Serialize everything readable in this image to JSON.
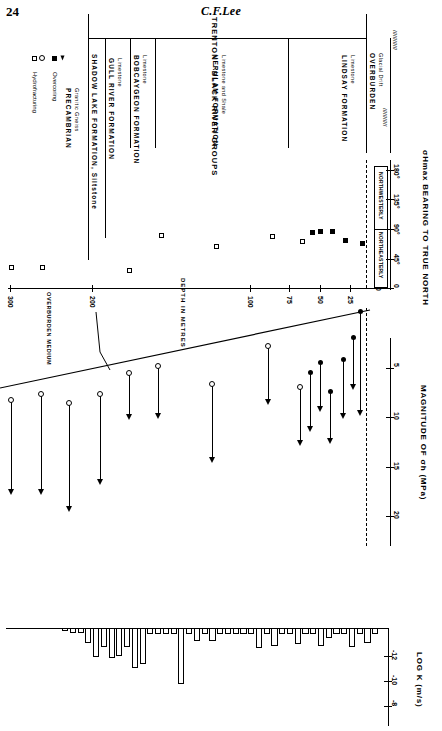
{
  "page": {
    "number": "24",
    "author": "C.F.Lee"
  },
  "figure": {
    "group_header": "TRENTON - BLACK  RIVER   GROUPS",
    "formations": [
      {
        "name": "PRECAMBRIAN",
        "sub": "Granitic Gneiss"
      },
      {
        "name": "SHADOW LAKE FORMATION, Siltstone",
        "sub": ""
      },
      {
        "name": "GULL RIVER FORMATION",
        "sub": "Limestone"
      },
      {
        "name": "BOBCAYGEON FORMATION",
        "sub": "Limestone"
      },
      {
        "name": "VERULAM FORMATION",
        "sub": "Limestone and Shale"
      },
      {
        "name": "LINDSAY FORMATION",
        "sub": "Limestone"
      },
      {
        "name": "OVERBURDEN",
        "sub": "Glacial Drift"
      }
    ],
    "legend": [
      {
        "marker": "filled-square-and-filled-triangle",
        "label": "Overcoring"
      },
      {
        "marker": "open-square-and-open-circle",
        "label": "Hydrofracturing"
      }
    ],
    "annotation": "OVERBURDEN MEDIUM"
  },
  "chart_data": [
    {
      "type": "scatter",
      "title": "Sigma-Hmax bearing vs depth",
      "ylabel": "σHmax  BEARING TO TRUE NORTH",
      "xlabel": "DEPTH  IN  METRES",
      "ytick_labels": [
        "0",
        "45°",
        "90°",
        "135°",
        "180°"
      ],
      "ytick_values": [
        0,
        45,
        90,
        135,
        180
      ],
      "ylim": [
        0,
        190
      ],
      "xtick_labels": [
        "0",
        "25",
        "50",
        "75",
        "100",
        "200",
        "300"
      ],
      "xtick_values": [
        0,
        25,
        50,
        75,
        100,
        200,
        300
      ],
      "xlim": [
        0,
        320
      ],
      "zone_labels": [
        "NORTHEASTERLY",
        "NORTHWESTERLY"
      ],
      "grid": false,
      "series": [
        {
          "name": "Hydrofracturing",
          "marker": "open-square",
          "points": [
            {
              "depth": 300,
              "bearing": 30
            },
            {
              "depth": 275,
              "bearing": 30
            },
            {
              "depth": 213,
              "bearing": 25
            },
            {
              "depth": 185,
              "bearing": 72
            },
            {
              "depth": 150,
              "bearing": 57
            },
            {
              "depth": 85,
              "bearing": 72
            },
            {
              "depth": 60,
              "bearing": 60
            }
          ]
        },
        {
          "name": "Overcoring",
          "marker": "filled-square",
          "points": [
            {
              "depth": 52,
              "bearing": 83
            },
            {
              "depth": 46,
              "bearing": 85
            },
            {
              "depth": 38,
              "bearing": 85
            },
            {
              "depth": 30,
              "bearing": 72
            },
            {
              "depth": 12,
              "bearing": 68
            }
          ]
        }
      ]
    },
    {
      "type": "range-line",
      "title": "Magnitude of minimum horizontal stress vs depth",
      "ylabel": "MAGNITUDE OF  σh  (MPa)",
      "ytick_labels": [
        "5",
        "10",
        "15",
        "20"
      ],
      "ytick_values": [
        5,
        10,
        15,
        20
      ],
      "ylim": [
        0,
        22
      ],
      "xlabel": "DEPTH  IN  METRES",
      "ranges": [
        {
          "depth": 300,
          "method": "Hydrofracturing",
          "top": 9.6,
          "bottom": 17.6
        },
        {
          "depth": 275,
          "method": "Hydrofracturing",
          "top": 9.0,
          "bottom": 17.5
        },
        {
          "depth": 250,
          "method": "Hydrofracturing",
          "top": 10.0,
          "bottom": 18.6
        },
        {
          "depth": 213,
          "method": "Hydrofracturing",
          "top": 9.2,
          "bottom": 16.9
        },
        {
          "depth": 185,
          "method": "Hydrofracturing",
          "top": 7.8,
          "bottom": 11.9
        },
        {
          "depth": 160,
          "method": "Hydrofracturing",
          "top": 7.3,
          "bottom": 11.9
        },
        {
          "depth": 135,
          "method": "Hydrofracturing",
          "top": 8.8,
          "bottom": 16.1
        },
        {
          "depth": 85,
          "method": "Hydrofracturing",
          "top": 6.4,
          "bottom": 10.0
        },
        {
          "depth": 62,
          "method": "Hydrofracturing",
          "top": 8.8,
          "bottom": 14.4
        },
        {
          "depth": 55,
          "method": "Overcoring",
          "top": 7.8,
          "bottom": 13.2
        },
        {
          "depth": 48,
          "method": "Overcoring",
          "top": 7.0,
          "bottom": 10.4
        },
        {
          "depth": 42,
          "method": "Overcoring",
          "top": 9.0,
          "bottom": 14.3
        },
        {
          "depth": 33,
          "method": "Overcoring",
          "top": 6.9,
          "bottom": 11.8
        },
        {
          "depth": 24,
          "method": "Overcoring",
          "top": 4.5,
          "bottom": 8.8
        },
        {
          "depth": 18,
          "method": "Overcoring",
          "top": 2.0,
          "bottom": 10.2
        }
      ]
    },
    {
      "type": "bar",
      "title": "Hydraulic conductivity profile",
      "ylabel": "LOG K (m/s)",
      "ytick_labels": [
        "-12",
        "-10",
        "-8"
      ],
      "ytick_values": [
        -12,
        -10,
        -8
      ],
      "ylim": [
        -13.5,
        -6.5
      ],
      "xlabel": "DEPTH  IN  METRES",
      "values": [
        -7.9,
        -8.6,
        -7.9,
        -8.9,
        -7.9,
        -7.9,
        -8.2,
        -8.8,
        -7.9,
        -7.9,
        -8.7,
        -7.9,
        -7.9,
        -8.8,
        -7.9,
        -9.0,
        -7.9,
        -7.9,
        -7.9,
        -7.9,
        -7.9,
        -8.4,
        -7.9,
        -8.4,
        -7.9,
        -11.9,
        -7.9,
        -7.9,
        -7.9,
        -7.9,
        -10.3,
        -10.6,
        -8.9,
        -9.6,
        -9.8,
        -8.9,
        -9.7,
        -8.6,
        -7.8,
        -7.8,
        -7.6
      ]
    }
  ]
}
